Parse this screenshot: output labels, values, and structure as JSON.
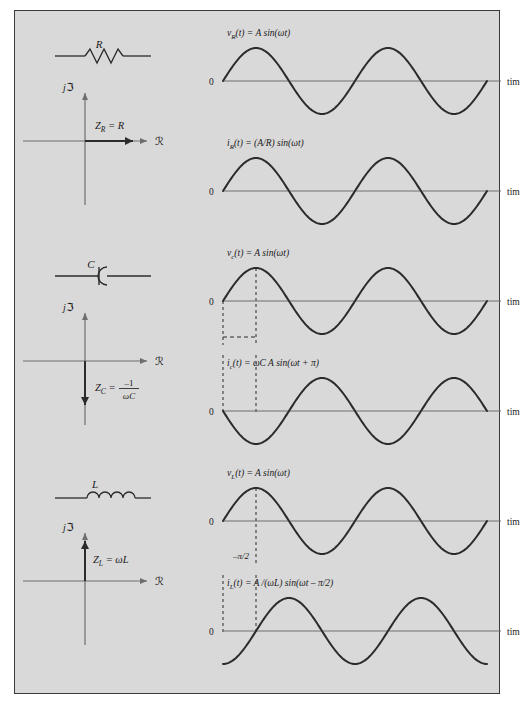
{
  "figure": {
    "background": "#d9d9d9",
    "border_color": "#3a3a3a",
    "curve_color": "#2b2b2b",
    "axis_color": "#6e6e6e"
  },
  "axis_labels": {
    "imaginary": "j",
    "imaginary_symbol": "ℑ",
    "real_symbol": "ℛ",
    "time": "time",
    "zero": "0"
  },
  "sections": [
    {
      "id": "resistor",
      "component_label": "R",
      "component_symbol": "resistor-symbol",
      "impedance": {
        "label_main": "Z",
        "label_sub": "R",
        "label_rest": " = R",
        "direction": "right",
        "axis": "real-positive"
      },
      "waveforms": [
        {
          "id": "vr",
          "equation_parts": {
            "v": "v",
            "sub": "R",
            "rest": "(t) = A sin(ωt)"
          },
          "equation_plain": "v_R(t) = A sin(ωt)",
          "phase_deg": 0,
          "shape": "sine",
          "markers": []
        },
        {
          "id": "ir",
          "equation_parts": {
            "v": "i",
            "sub": "R",
            "rest": "(t) = (A/R) sin(ωt)"
          },
          "equation_plain": "i_R(t) = (A/R) sin(ωt)",
          "phase_deg": 0,
          "shape": "sine",
          "markers": []
        }
      ]
    },
    {
      "id": "capacitor",
      "component_label": "C",
      "component_symbol": "capacitor-symbol",
      "impedance": {
        "label_main": "Z",
        "label_sub": "C",
        "label_rest": " = ",
        "numerator": "–1",
        "denominator": "ωC",
        "direction": "down",
        "axis": "imaginary-negative"
      },
      "waveforms": [
        {
          "id": "vc",
          "equation_parts": {
            "v": "v",
            "sub": "c",
            "rest": "(t) = A sin(ωt)"
          },
          "equation_plain": "v_c(t) = A sin(ωt)",
          "phase_deg": 0,
          "shape": "sine",
          "markers": [
            "peak-dashed",
            "origin-dashed"
          ]
        },
        {
          "id": "ic",
          "equation_parts": {
            "v": "i",
            "sub": "c",
            "rest": "(t) = ωC A sin(ωt + π)"
          },
          "equation_plain": "i_c(t) = ωC A sin(ωt + π)",
          "phase_deg": 180,
          "shape": "sine",
          "markers": [
            "phase-dashed"
          ]
        }
      ]
    },
    {
      "id": "inductor",
      "component_label": "L",
      "component_symbol": "inductor-symbol",
      "impedance": {
        "label_main": "Z",
        "label_sub": "L",
        "label_rest": " = ωL",
        "direction": "up",
        "axis": "imaginary-positive"
      },
      "waveforms": [
        {
          "id": "vl",
          "equation_parts": {
            "v": "v",
            "sub": "L",
            "rest": "(t) = A sin(ωt)"
          },
          "equation_plain": "v_L(t) = A sin(ωt)",
          "phase_deg": 0,
          "shape": "sine",
          "markers": [
            "peak-dashed"
          ],
          "annotation": "–π/2"
        },
        {
          "id": "il",
          "equation_parts": {
            "v": "i",
            "sub": "L",
            "rest": "(t) = A /(ωL) sin(ωt – π/2)"
          },
          "equation_plain": "i_L(t) = A /(ωL) sin(ωt – π/2)",
          "phase_deg": -90,
          "shape": "sine",
          "markers": [
            "phase-dashed"
          ]
        }
      ]
    }
  ],
  "phase_annotation": {
    "label": "–π/2"
  }
}
